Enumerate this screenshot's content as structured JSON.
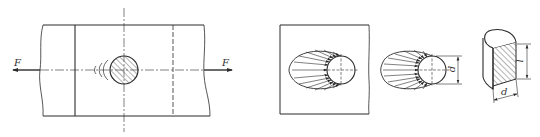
{
  "figure": {
    "colors": {
      "line": "#2b2b2b",
      "hatch": "#444444",
      "background": "#ffffff"
    },
    "panels": [
      {
        "id": "plate-with-pin",
        "labels": {
          "force_left": "F",
          "force_right": "F"
        }
      },
      {
        "id": "actual-bearing-pressure",
        "labels": {}
      },
      {
        "id": "simplified-bearing-pressure",
        "labels": {
          "diameter": "d"
        }
      },
      {
        "id": "pin-bearing-area",
        "labels": {
          "length": "l",
          "diameter": "d"
        }
      }
    ]
  }
}
